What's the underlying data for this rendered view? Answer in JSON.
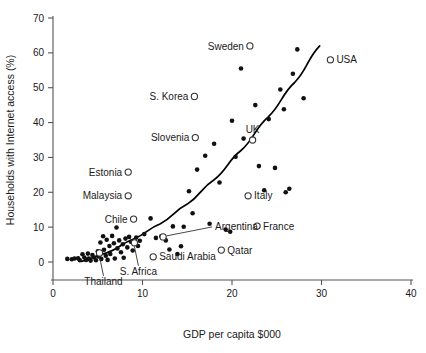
{
  "chart_data": {
    "type": "scatter",
    "title": "",
    "xlabel": "GDP per capita $000",
    "ylabel": "Households with Internet access (%)",
    "xlim": [
      0,
      40
    ],
    "ylim": [
      0,
      70
    ],
    "xticks": [
      "0",
      "10",
      "20",
      "30",
      "40"
    ],
    "xtick_values": [
      0,
      10,
      20,
      30,
      40
    ],
    "yticks": [
      "0",
      "10",
      "20",
      "30",
      "40",
      "50",
      "60",
      "70"
    ],
    "ytick_values": [
      0,
      10,
      20,
      30,
      40,
      50,
      60,
      70
    ],
    "grid": false,
    "legend": "none",
    "series": [
      {
        "name": "Labelled countries",
        "marker": "open-circle",
        "points": [
          {
            "label": "Sweden",
            "x": 22.0,
            "y": 62.0,
            "label_side": "left"
          },
          {
            "label": "USA",
            "x": 31.0,
            "y": 58.0,
            "label_side": "right"
          },
          {
            "label": "S. Korea",
            "x": 15.8,
            "y": 47.5,
            "label_side": "left"
          },
          {
            "label": "Slovenia",
            "x": 15.9,
            "y": 35.7,
            "label_side": "left"
          },
          {
            "label": "UK",
            "x": 22.3,
            "y": 35.0,
            "label_side": "above"
          },
          {
            "label": "Estonia",
            "x": 8.4,
            "y": 25.8,
            "label_side": "left"
          },
          {
            "label": "Italy",
            "x": 21.8,
            "y": 19.0,
            "label_side": "right"
          },
          {
            "label": "Malaysia",
            "x": 8.4,
            "y": 19.0,
            "label_side": "left"
          },
          {
            "label": "Chile",
            "x": 9.0,
            "y": 12.3,
            "label_side": "left"
          },
          {
            "label": "France",
            "x": 22.8,
            "y": 10.3,
            "label_side": "right"
          },
          {
            "label": "Argentina",
            "x": 12.3,
            "y": 7.2,
            "label_side": "leader-right"
          },
          {
            "label": "Qatar",
            "x": 18.8,
            "y": 3.4,
            "label_side": "right"
          },
          {
            "label": "S. Africa",
            "x": 9.1,
            "y": 5.5,
            "label_side": "leader-below"
          },
          {
            "label": "Saudi Arabia",
            "x": 11.2,
            "y": 1.5,
            "label_side": "right"
          },
          {
            "label": "Thailand",
            "x": 5.2,
            "y": 2.6,
            "label_side": "leader-below"
          }
        ]
      },
      {
        "name": "Other countries",
        "marker": "filled-dot",
        "points": [
          {
            "x": 1.6,
            "y": 0.9
          },
          {
            "x": 2.1,
            "y": 0.8
          },
          {
            "x": 2.4,
            "y": 1.0
          },
          {
            "x": 2.8,
            "y": 1.1
          },
          {
            "x": 3.0,
            "y": 0.5
          },
          {
            "x": 3.3,
            "y": 2.2
          },
          {
            "x": 3.5,
            "y": 1.3
          },
          {
            "x": 3.7,
            "y": 0.6
          },
          {
            "x": 3.9,
            "y": 2.4
          },
          {
            "x": 4.0,
            "y": 1.0
          },
          {
            "x": 4.2,
            "y": 0.4
          },
          {
            "x": 4.4,
            "y": 2.0
          },
          {
            "x": 4.6,
            "y": 1.3
          },
          {
            "x": 4.8,
            "y": 0.5
          },
          {
            "x": 5.0,
            "y": 3.1
          },
          {
            "x": 5.1,
            "y": 1.6
          },
          {
            "x": 5.3,
            "y": 5.6
          },
          {
            "x": 5.4,
            "y": 0.9
          },
          {
            "x": 5.6,
            "y": 7.4
          },
          {
            "x": 5.7,
            "y": 3.5
          },
          {
            "x": 5.9,
            "y": 1.8
          },
          {
            "x": 6.0,
            "y": 6.4
          },
          {
            "x": 6.1,
            "y": 0.6
          },
          {
            "x": 6.3,
            "y": 4.6
          },
          {
            "x": 6.4,
            "y": 2.3
          },
          {
            "x": 6.6,
            "y": 7.5
          },
          {
            "x": 6.8,
            "y": 5.4
          },
          {
            "x": 6.9,
            "y": 1.0
          },
          {
            "x": 7.1,
            "y": 9.9
          },
          {
            "x": 7.2,
            "y": 3.9
          },
          {
            "x": 7.4,
            "y": 6.2
          },
          {
            "x": 7.6,
            "y": 2.8
          },
          {
            "x": 7.8,
            "y": 5.1
          },
          {
            "x": 7.9,
            "y": 1.2
          },
          {
            "x": 8.1,
            "y": 6.7
          },
          {
            "x": 8.3,
            "y": 4.2
          },
          {
            "x": 8.5,
            "y": 7.2
          },
          {
            "x": 8.7,
            "y": 5.8
          },
          {
            "x": 8.9,
            "y": 3.3
          },
          {
            "x": 9.3,
            "y": 7.0
          },
          {
            "x": 9.5,
            "y": 4.6
          },
          {
            "x": 9.7,
            "y": 6.1
          },
          {
            "x": 10.2,
            "y": 8.0
          },
          {
            "x": 10.9,
            "y": 12.5
          },
          {
            "x": 11.5,
            "y": 6.9
          },
          {
            "x": 12.1,
            "y": 7.4
          },
          {
            "x": 12.6,
            "y": 6.2
          },
          {
            "x": 13.0,
            "y": 3.6
          },
          {
            "x": 13.4,
            "y": 10.2
          },
          {
            "x": 13.9,
            "y": 2.3
          },
          {
            "x": 14.3,
            "y": 4.5
          },
          {
            "x": 14.6,
            "y": 10.1
          },
          {
            "x": 15.2,
            "y": 20.3
          },
          {
            "x": 15.6,
            "y": 14.0
          },
          {
            "x": 16.1,
            "y": 26.5
          },
          {
            "x": 17.0,
            "y": 30.5
          },
          {
            "x": 17.5,
            "y": 11.0
          },
          {
            "x": 18.0,
            "y": 33.9
          },
          {
            "x": 18.6,
            "y": 22.8
          },
          {
            "x": 19.3,
            "y": 9.3
          },
          {
            "x": 19.8,
            "y": 8.7
          },
          {
            "x": 20.0,
            "y": 40.5
          },
          {
            "x": 20.4,
            "y": 30.2
          },
          {
            "x": 21.3,
            "y": 35.4
          },
          {
            "x": 22.6,
            "y": 45.0
          },
          {
            "x": 23.0,
            "y": 27.5
          },
          {
            "x": 23.6,
            "y": 20.6
          },
          {
            "x": 24.1,
            "y": 41.0
          },
          {
            "x": 24.8,
            "y": 27.0
          },
          {
            "x": 25.4,
            "y": 49.5
          },
          {
            "x": 25.8,
            "y": 43.8
          },
          {
            "x": 26.0,
            "y": 20.0
          },
          {
            "x": 26.4,
            "y": 21.0
          },
          {
            "x": 26.8,
            "y": 54.0
          },
          {
            "x": 27.3,
            "y": 61.0
          },
          {
            "x": 28.0,
            "y": 47.0
          },
          {
            "x": 21.0,
            "y": 55.5
          }
        ]
      }
    ],
    "trend_line": {
      "name": "fitted exponential trend",
      "points": [
        {
          "x": 3.2,
          "y": 0.2
        },
        {
          "x": 6.0,
          "y": 2.6
        },
        {
          "x": 9.0,
          "y": 6.6
        },
        {
          "x": 12.0,
          "y": 11.0
        },
        {
          "x": 15.0,
          "y": 16.6
        },
        {
          "x": 18.0,
          "y": 23.6
        },
        {
          "x": 21.0,
          "y": 32.0
        },
        {
          "x": 24.0,
          "y": 41.5
        },
        {
          "x": 27.0,
          "y": 51.5
        },
        {
          "x": 29.8,
          "y": 62.0
        }
      ]
    },
    "colors": {
      "point_fill": "#111111",
      "open_marker_stroke": "#333333",
      "axis": "#555555",
      "trend": "#000000",
      "background": "#ffffff"
    }
  }
}
